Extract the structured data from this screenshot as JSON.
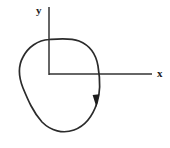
{
  "figure": {
    "background_color": "#ffffff",
    "stroke_color": "#2b2b2b",
    "axis_color": "#333333",
    "label_color": "#1c1c1c",
    "width": 170,
    "height": 148
  },
  "axes": {
    "origin": {
      "x": 49,
      "y": 74
    },
    "x_axis": {
      "label": "x",
      "label_x": 157,
      "label_y": 77,
      "start_x": 49,
      "end_x": 152,
      "y": 74
    },
    "y_axis": {
      "label": "y",
      "label_x": 36,
      "label_y": 14,
      "x": 49,
      "start_y": 7,
      "end_y": 75
    }
  },
  "curve": {
    "name": "closed-oriented-curve",
    "shape": "tilted closed oval loop",
    "orientation": "clockwise",
    "path": "M 49 39.5 C 38 40 28 47 23 57 C 18 66 19 78 23 88 C 28 100 33 112 42 122 C 51 131 63 134 74 130 C 85 126 93 115 97 103 C 101 91 100 78 98 66 C 96 54 89 45 79 41 C 70 37.5 58 38.8 49 39.5 Z",
    "extremes": {
      "top_y": 38,
      "bottom_y": 133,
      "left_x": 19,
      "right_x": 99
    },
    "y_axis_crossing_y": 39.5,
    "x_axis_crossing_x": 97.5,
    "arrow": {
      "name": "direction-arrowhead",
      "tip_x": 96,
      "tip_y": 107,
      "points": "96.4,107 92.6,95 99.2,94.2",
      "direction": "downward"
    }
  }
}
